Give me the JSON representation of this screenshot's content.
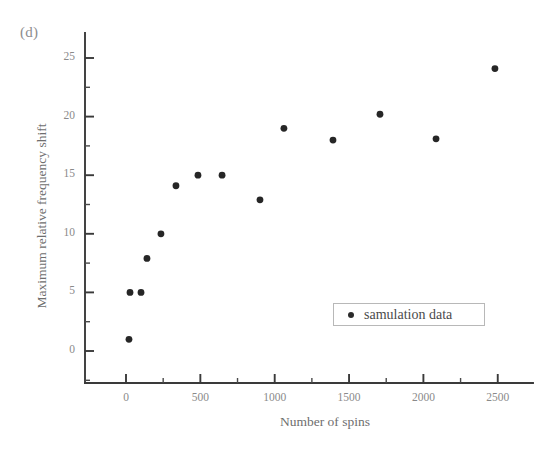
{
  "figure": {
    "panel_label": "(d)",
    "background_color": "#ffffff",
    "marker_color": "#262626",
    "axis_color": "#3a3a3a",
    "text_color": "#6e6e6e"
  },
  "legend": {
    "position": "inside-lower-right",
    "entries": [
      {
        "label": "samulation data",
        "marker": "filled-circle",
        "color": "#2b2b2b"
      }
    ]
  },
  "chart_data": {
    "type": "scatter",
    "title": "",
    "subtitle": "",
    "xlabel": "Number of spins",
    "ylabel": "Maximum relative frequency shift",
    "xlim": [
      -150,
      2750
    ],
    "ylim": [
      -2.5,
      27.5
    ],
    "xticks": [
      0,
      500,
      1000,
      1500,
      2000,
      2500
    ],
    "xtick_labels": [
      "0",
      "500",
      "1000",
      "1500",
      "2000",
      "2500"
    ],
    "yticks": [
      0,
      5,
      10,
      15,
      20,
      25
    ],
    "ytick_labels": [
      "0",
      "5",
      "10",
      "15",
      "20",
      "25"
    ],
    "x_minor_tick_step": 250,
    "y_minor_tick_step": 2.5,
    "grid": false,
    "legend_position": "lower right inside axes",
    "series": [
      {
        "name": "samulation data",
        "marker": "filled-circle",
        "color": "#262626",
        "points": [
          {
            "x": 20,
            "y": 1.0
          },
          {
            "x": 27,
            "y": 5.0
          },
          {
            "x": 101,
            "y": 5.0
          },
          {
            "x": 141,
            "y": 7.9
          },
          {
            "x": 235,
            "y": 10.0
          },
          {
            "x": 336,
            "y": 14.1
          },
          {
            "x": 484,
            "y": 15.0
          },
          {
            "x": 646,
            "y": 15.0
          },
          {
            "x": 901,
            "y": 12.9
          },
          {
            "x": 1062,
            "y": 19.0
          },
          {
            "x": 1392,
            "y": 18.0
          },
          {
            "x": 1708,
            "y": 20.2
          },
          {
            "x": 2085,
            "y": 18.1
          },
          {
            "x": 2481,
            "y": 24.1
          }
        ]
      }
    ]
  }
}
